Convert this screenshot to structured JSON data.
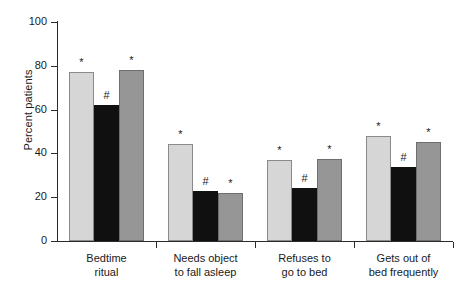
{
  "chart_data": {
    "type": "bar",
    "title": "",
    "xlabel": "",
    "ylabel": "Percent patients",
    "ylim": [
      0,
      100
    ],
    "yticks": [
      0,
      20,
      40,
      60,
      80,
      100
    ],
    "ytick_labels": [
      "0",
      "20",
      "40",
      "60",
      "80",
      "100"
    ],
    "grid": false,
    "legend": "none",
    "categories": [
      "Bedtime\nritual",
      "Needs object\nto fall asleep",
      "Refuses to\ngo to bed",
      "Gets out of\nbed frequently"
    ],
    "series": [
      {
        "name": "light-gray",
        "color": "#d6d6d6",
        "values": [
          77,
          44.5,
          37,
          48
        ]
      },
      {
        "name": "black",
        "color": "#101010",
        "values": [
          62,
          23,
          24,
          34
        ]
      },
      {
        "name": "mid-gray",
        "color": "#969696",
        "values": [
          78,
          22,
          37.5,
          45
        ]
      }
    ],
    "annotations": [
      {
        "group": 0,
        "series": 0,
        "text": "*"
      },
      {
        "group": 0,
        "series": 1,
        "text": "#"
      },
      {
        "group": 0,
        "series": 2,
        "text": "*"
      },
      {
        "group": 1,
        "series": 0,
        "text": "*"
      },
      {
        "group": 1,
        "series": 1,
        "text": "#"
      },
      {
        "group": 1,
        "series": 2,
        "text": "*"
      },
      {
        "group": 2,
        "series": 0,
        "text": "*"
      },
      {
        "group": 2,
        "series": 1,
        "text": "#"
      },
      {
        "group": 2,
        "series": 2,
        "text": "*"
      },
      {
        "group": 3,
        "series": 0,
        "text": "*"
      },
      {
        "group": 3,
        "series": 1,
        "text": "#"
      },
      {
        "group": 3,
        "series": 2,
        "text": "*"
      }
    ]
  }
}
